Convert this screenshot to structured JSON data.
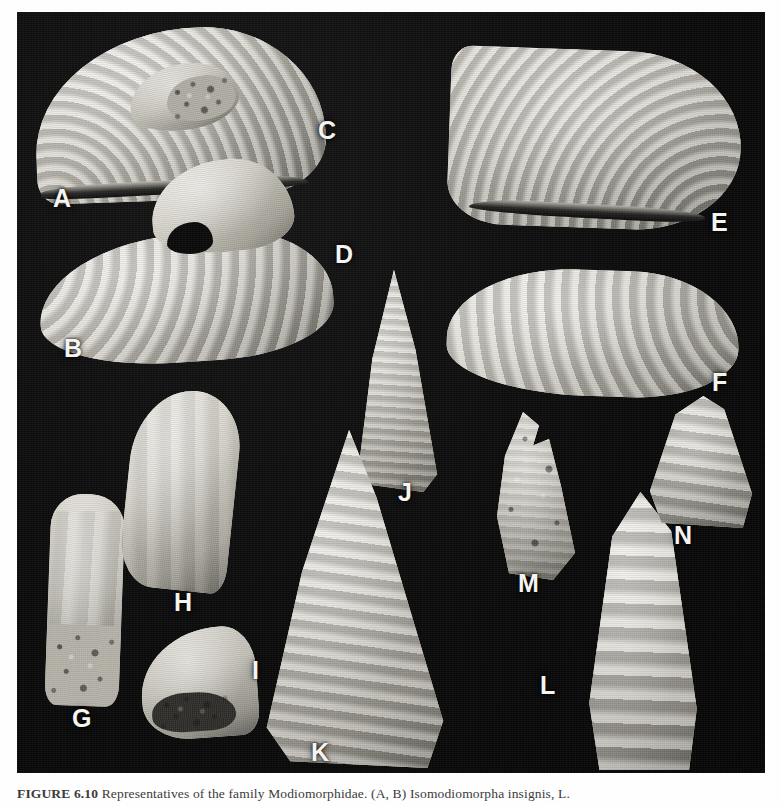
{
  "figure": {
    "plate_background_color": "#0a0a0a",
    "specimen_color": "#c9c6bd",
    "label_color": "#f4f4f0",
    "page_background_color": "#ffffff",
    "caption": {
      "figure_number": "FIGURE 6.10",
      "separator": "  ",
      "text": "Representatives of the family Modiomorphidae. (A, B) Isomodiomorpha insignis, L.",
      "full_line": "FIGURE 6.10  Representatives of the family Modiomorphidae. (A, B) Isomodiomorpha insignis, L."
    },
    "panels": [
      {
        "label": "A",
        "x": 53,
        "y": 186,
        "specimen": "ribbed-fan-shell-left",
        "description": "large ribbed fan-shaped bivalve, hinge at lower left"
      },
      {
        "label": "B",
        "x": 64,
        "y": 336,
        "specimen": "elongate-ribbed-shell",
        "description": "elongate ribbed mussel-shaped valve"
      },
      {
        "label": "C",
        "x": 318,
        "y": 118,
        "specimen": "small-bean-internal-mold",
        "description": "small bean-shaped valve with coarse granular infill"
      },
      {
        "label": "D",
        "x": 335,
        "y": 242,
        "specimen": "kidney-shaped-valve",
        "description": "smooth kidney-shaped valve"
      },
      {
        "label": "E",
        "x": 711,
        "y": 210,
        "specimen": "ribbed-fan-shell-right",
        "description": "large ribbed fan-shaped bivalve, mirrored"
      },
      {
        "label": "F",
        "x": 712,
        "y": 370,
        "specimen": "broad-ribbed-oval-shell",
        "description": "broad ribbed oval valve with pointed posterior"
      },
      {
        "label": "G",
        "x": 72,
        "y": 706,
        "specimen": "tapering-tusk-eroded",
        "description": "tapering tusk-like specimen, eroded base"
      },
      {
        "label": "H",
        "x": 174,
        "y": 590,
        "specimen": "curved-claw-shell",
        "description": "curved claw-shaped valve"
      },
      {
        "label": "I",
        "x": 252,
        "y": 658,
        "specimen": "small-hooked-valve",
        "description": "small hooked valve with dark infill"
      },
      {
        "label": "J",
        "x": 398,
        "y": 480,
        "specimen": "narrow-ribbed-cone",
        "description": "narrow ribbed triangular cone"
      },
      {
        "label": "K",
        "x": 311,
        "y": 740,
        "specimen": "large-ribbed-triangle",
        "description": "large strongly ribbed triangular shell"
      },
      {
        "label": "L",
        "x": 540,
        "y": 673,
        "specimen": "banded-conical-shell",
        "description": "conical shell with strong transverse bands"
      },
      {
        "label": "M",
        "x": 518,
        "y": 571,
        "specimen": "ragged-eroded-cone",
        "description": "ragged eroded conical fragment"
      },
      {
        "label": "N",
        "x": 674,
        "y": 523,
        "specimen": "small-ribbed-triangle",
        "description": "small ribbed triangular shell"
      }
    ]
  }
}
